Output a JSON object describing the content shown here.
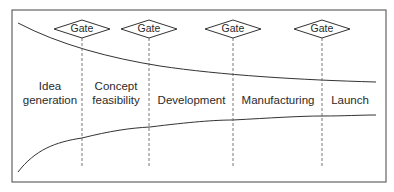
{
  "diagram": {
    "type": "stage-gate funnel",
    "gate_label": "Gate",
    "gates": [
      {
        "label": "Gate"
      },
      {
        "label": "Gate"
      },
      {
        "label": "Gate"
      },
      {
        "label": "Gate"
      }
    ],
    "stages": [
      {
        "line1": "Idea",
        "line2": "generation"
      },
      {
        "line1": "Concept",
        "line2": "feasibility"
      },
      {
        "line1": "Development",
        "line2": ""
      },
      {
        "line1": "Manufacturing",
        "line2": ""
      },
      {
        "line1": "Launch",
        "line2": ""
      }
    ],
    "colors": {
      "line": "#333333",
      "frame": "#444444",
      "background": "#ffffff"
    }
  }
}
